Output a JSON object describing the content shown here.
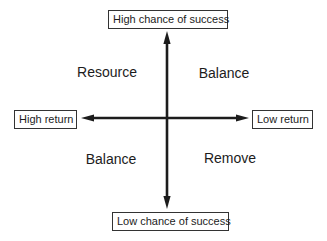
{
  "diagram": {
    "type": "quadrant-matrix",
    "axes": {
      "vertical_top_label": "High chance of success",
      "vertical_bottom_label": "Low chance of success",
      "horizontal_left_label": "High return",
      "horizontal_right_label": "Low return"
    },
    "quadrants": {
      "top_left": "Resource",
      "top_right": "Balance",
      "bottom_left": "Balance",
      "bottom_right": "Remove"
    },
    "colors": {
      "background": "#ffffff",
      "line": "#1c1c1c",
      "text": "#1c1c1c",
      "box_border": "#333333",
      "box_background": "#ffffff"
    }
  }
}
